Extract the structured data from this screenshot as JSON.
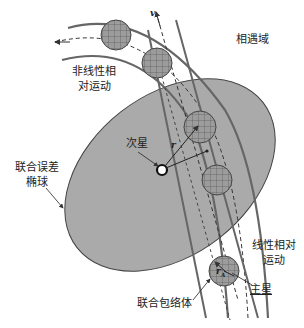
{
  "diagram": {
    "title": "",
    "labels": {
      "nonlinear_motion": [
        "非线性相",
        "对运动"
      ],
      "encounter_domain": "相遇域",
      "secondary_star": "次星",
      "joint_error_ellipsoid": [
        "联合误差",
        "椭球"
      ],
      "linear_motion": [
        "线性相对",
        "运动"
      ],
      "primary_star": "主星",
      "joint_envelope": "联合包络体",
      "velocity_symbol": "v",
      "distance_symbol": "r",
      "radius_symbol": "r",
      "radius_subscript": "A"
    },
    "colors": {
      "ellipse_fill": "#a9a9a9",
      "sphere_fill": "#9a9a9a",
      "line": "#555555",
      "text": "#222222"
    }
  }
}
